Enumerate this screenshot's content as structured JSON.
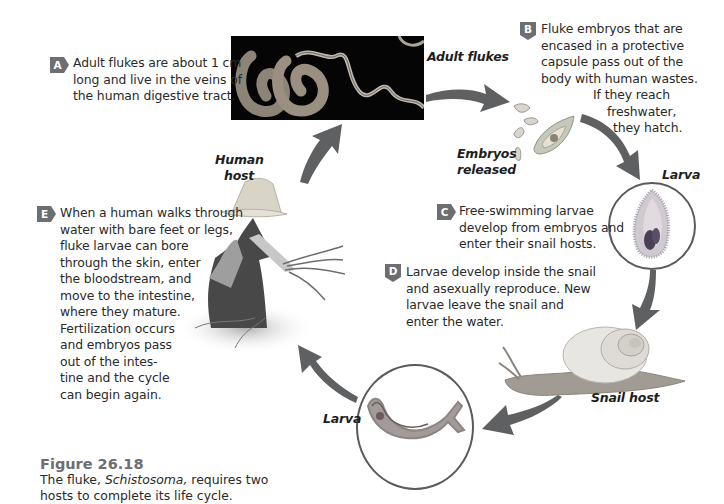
{
  "figure": {
    "number": "Figure 26.18",
    "caption_parts": [
      "The fluke, ",
      "Schistosoma,",
      " requires two"
    ],
    "caption_line2": "hosts to complete its life cycle."
  },
  "steps": [
    {
      "badge": "A",
      "badge_icon": "arrow-right-badge",
      "lines": [
        "Adult flukes are about 1 cm",
        "long and live in the veins of",
        "the human digestive tract."
      ]
    },
    {
      "badge": "B",
      "badge_icon": "arrow-down-badge",
      "lines": [
        "Fluke embryos that are",
        "encased in a protective",
        "capsule pass out of the",
        "body with human wastes.",
        "If they reach",
        "freshwater,",
        "they hatch."
      ]
    },
    {
      "badge": "C",
      "badge_icon": "arrow-right-badge",
      "lines": [
        "Free-swimming larvae",
        "develop from embryos and",
        "enter their snail hosts."
      ]
    },
    {
      "badge": "D",
      "badge_icon": "arrow-down-badge",
      "lines": [
        "Larvae develop inside the snail",
        "and asexually reproduce. New",
        "larvae leave the snail and",
        "enter the water."
      ]
    },
    {
      "badge": "E",
      "badge_icon": "arrow-right-badge",
      "lines": [
        "When a human walks through",
        "water with bare feet or legs,",
        "fluke larvae can bore",
        "through the skin, enter",
        "the bloodstream, and",
        "move to the intestine,",
        "where they mature.",
        "Fertilization occurs",
        "and embryos pass",
        "out of the intes-",
        "tine and the cycle",
        "can begin again."
      ]
    }
  ],
  "labels": {
    "adult_flukes": "Adult flukes",
    "embryos_line1": "Embryos",
    "embryos_line2": "released",
    "larva_top": "Larva",
    "snail_host": "Snail host",
    "larva_bottom": "Larva",
    "human_line1": "Human",
    "human_line2": "host"
  },
  "colors": {
    "badge": "#6d6e71",
    "arrow": "#5f6062",
    "circle_border": "#5a5a5a",
    "figure_title": "#6d6e71",
    "text": "#2a2a2a"
  }
}
